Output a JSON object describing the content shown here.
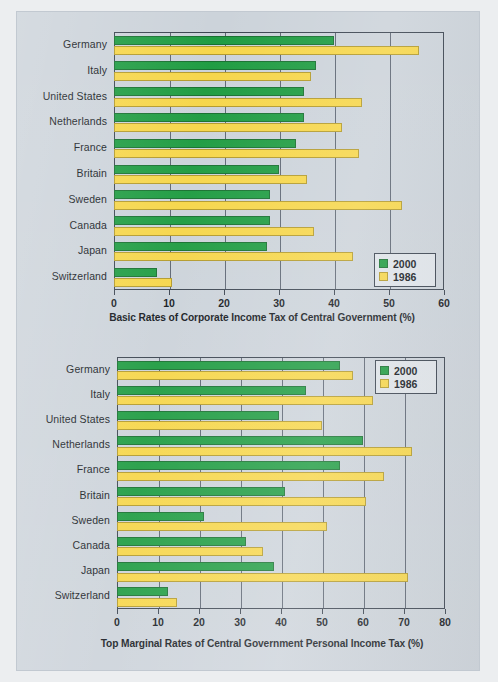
{
  "figure": {
    "background_color": "#ccd3da",
    "series_colors": {
      "s2000": "#1f9c42",
      "s1986": "#f6d64a"
    }
  },
  "legend": {
    "entries": [
      {
        "key": "s2000",
        "label": "2000"
      },
      {
        "key": "s1986",
        "label": "1986"
      }
    ]
  },
  "chart_data": [
    {
      "type": "bar",
      "orientation": "horizontal",
      "title": "",
      "xlabel": "Basic Rates of Corporate Income Tax of Central Government (%)",
      "ylabel": "",
      "xlim": [
        0,
        60
      ],
      "xticks": [
        0,
        10,
        20,
        30,
        40,
        50,
        60
      ],
      "xtick_labels": [
        "0",
        "10",
        "20",
        "30",
        "40",
        "50",
        "60"
      ],
      "grid": true,
      "legend_position": "bottom-right",
      "categories": [
        "Germany",
        "Italy",
        "United States",
        "Netherlands",
        "France",
        "Britain",
        "Sweden",
        "Canada",
        "Japan",
        "Switzerland"
      ],
      "series": [
        {
          "name": "2000",
          "color": "#1f9c42",
          "values": [
            40,
            36.8,
            34.5,
            34.5,
            33,
            30,
            28.3,
            28.3,
            27.8,
            7.9
          ]
        },
        {
          "name": "1986",
          "color": "#f6d64a",
          "values": [
            55.5,
            35.9,
            45,
            41.5,
            44.5,
            35,
            52.4,
            36.4,
            43.4,
            10.6
          ]
        }
      ]
    },
    {
      "type": "bar",
      "orientation": "horizontal",
      "title": "",
      "xlabel": "Top Marginal Rates of Central Government Personal Income Tax (%)",
      "ylabel": "",
      "xlim": [
        0,
        80
      ],
      "xticks": [
        0,
        10,
        20,
        30,
        40,
        50,
        60,
        70,
        80
      ],
      "xtick_labels": [
        "0",
        "10",
        "20",
        "30",
        "40",
        "50",
        "60",
        "70",
        "80"
      ],
      "grid": true,
      "legend_position": "top-right",
      "categories": [
        "Germany",
        "Italy",
        "United States",
        "Netherlands",
        "France",
        "Britain",
        "Sweden",
        "Canada",
        "Japan",
        "Switzerland"
      ],
      "series": [
        {
          "name": "2000",
          "color": "#1f9c42",
          "values": [
            54.5,
            46,
            39.6,
            60,
            54.5,
            41,
            21.3,
            31.5,
            38.2,
            12.4
          ]
        },
        {
          "name": "1986",
          "color": "#f6d64a",
          "values": [
            57.5,
            62.4,
            50,
            72,
            65,
            60.7,
            51.2,
            35.5,
            71,
            14.6
          ]
        }
      ]
    }
  ]
}
